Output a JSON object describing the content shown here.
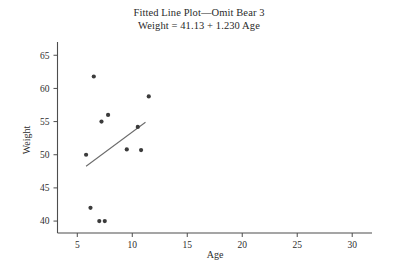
{
  "chart_data": {
    "type": "scatter",
    "title": "Fitted Line Plot—Omit Bear 3",
    "subtitle": "Weight = 41.13 + 1.230 Age",
    "xlabel": "Age",
    "ylabel": "Weight",
    "xlim": [
      3.2,
      31.8
    ],
    "ylim": [
      38.2,
      67.0
    ],
    "xticks": [
      5,
      10,
      15,
      20,
      25,
      30
    ],
    "yticks": [
      40,
      45,
      50,
      55,
      60,
      65
    ],
    "grid": false,
    "legend": false,
    "x": [
      5.8,
      6.2,
      6.5,
      7.0,
      7.2,
      7.5,
      7.8,
      9.5,
      10.5,
      10.8,
      11.5
    ],
    "y": [
      50.0,
      42.0,
      61.8,
      40.0,
      55.0,
      40.0,
      56.0,
      50.8,
      54.2,
      50.7,
      58.8
    ],
    "points": [
      {
        "age": 5.8,
        "weight": 50.0
      },
      {
        "age": 6.2,
        "weight": 42.0
      },
      {
        "age": 6.5,
        "weight": 61.8
      },
      {
        "age": 7.0,
        "weight": 40.0
      },
      {
        "age": 7.2,
        "weight": 55.0
      },
      {
        "age": 7.5,
        "weight": 40.0
      },
      {
        "age": 7.8,
        "weight": 56.0
      },
      {
        "age": 9.5,
        "weight": 50.8
      },
      {
        "age": 10.5,
        "weight": 54.2
      },
      {
        "age": 10.8,
        "weight": 50.7
      },
      {
        "age": 11.5,
        "weight": 58.8
      }
    ],
    "fit": {
      "intercept": 41.13,
      "slope": 1.23,
      "x_start": 5.8,
      "x_end": 11.2,
      "equation": "Weight = 41.13 + 1.230 Age"
    },
    "colors": {
      "point": "#3b3b3b",
      "line": "#6b6b6b",
      "axis": "#4d4d4d",
      "text": "#2d2d2d",
      "background": "#ffffff"
    }
  }
}
